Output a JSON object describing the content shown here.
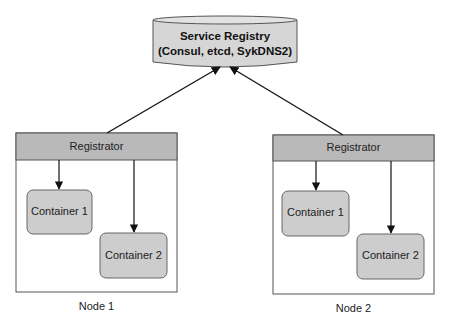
{
  "colors": {
    "registry_fill": "#d6d6d6",
    "registrator_fill": "#b9b9b9",
    "container_fill": "#cdcdcd",
    "stroke": "#444444",
    "arrow": "#111111"
  },
  "registry": {
    "title": "Service Registry",
    "subtitle": "(Consul, etcd, SykDNS2)"
  },
  "nodes": [
    {
      "label": "Node 1",
      "registrator": "Registrator",
      "containers": [
        {
          "label": "Container 1"
        },
        {
          "label": "Container 2"
        }
      ]
    },
    {
      "label": "Node 2",
      "registrator": "Registrator",
      "containers": [
        {
          "label": "Container 1"
        },
        {
          "label": "Container 2"
        }
      ]
    }
  ]
}
